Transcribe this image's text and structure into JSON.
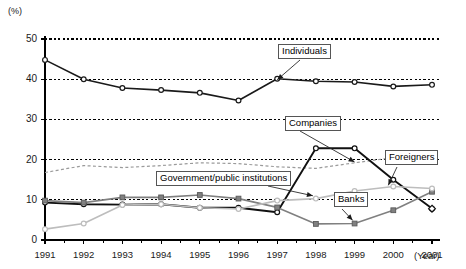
{
  "chart_data": {
    "type": "line",
    "title": "",
    "xlabel": "(Year)",
    "ylabel": "(%)",
    "ylim": [
      0,
      50
    ],
    "xlim": [
      1991,
      2001
    ],
    "grid": true,
    "grid_lines": [
      10,
      20,
      30,
      40,
      50
    ],
    "legend_position": "inline-callouts",
    "categories": [
      "1991",
      "1992",
      "1993",
      "1994",
      "1995",
      "1996",
      "1997",
      "1998",
      "1999",
      "2000",
      "2001"
    ],
    "series": [
      {
        "name": "Individuals",
        "marker": "open-circle",
        "color": "#1a1a1a",
        "values": [
          44.8,
          40.0,
          37.8,
          37.3,
          36.6,
          34.7,
          40.1,
          39.5,
          39.3,
          38.2,
          38.6
        ]
      },
      {
        "name": "Companies",
        "marker": "none",
        "style": "dashed",
        "color": "#9a9a9a",
        "values": [
          16.8,
          18.5,
          18.0,
          18.5,
          19.2,
          19.0,
          18.2,
          17.8,
          19.2,
          20.5,
          21.1
        ]
      },
      {
        "name": "Government/public institutions",
        "marker": "open-circle",
        "color": "#111111",
        "values": [
          9.3,
          8.9,
          8.8,
          8.9,
          8.0,
          8.0,
          6.9,
          22.8,
          22.8,
          15.0,
          7.8
        ]
      },
      {
        "name": "Banks",
        "marker": "filled-square",
        "color": "#808080",
        "values": [
          9.8,
          9.3,
          10.6,
          10.6,
          11.2,
          10.3,
          8.1,
          4.0,
          4.1,
          7.4,
          12.0
        ]
      },
      {
        "name": "Foreigners",
        "marker": "open-circle",
        "color": "#bdbdbd",
        "values": [
          2.7,
          4.1,
          8.7,
          8.9,
          8.0,
          7.7,
          9.8,
          10.3,
          12.2,
          13.3,
          12.8
        ]
      }
    ],
    "annotations": [
      {
        "label": "Individuals",
        "target_year": 1997,
        "target_value": 40.1
      },
      {
        "label": "Companies",
        "target_year": 1999,
        "target_value": 19.2
      },
      {
        "label": "Government/public institutions",
        "target_year": 1998,
        "target_value": 10.8
      },
      {
        "label": "Foreigners",
        "target_year": 2000,
        "target_value": 13.3
      },
      {
        "label": "Banks",
        "target_year": 1999,
        "target_value": 4.1
      }
    ]
  },
  "axis": {
    "unit_label": "(%)",
    "year_label": "(Year)",
    "y_ticks": [
      "0",
      "10",
      "20",
      "30",
      "40",
      "50"
    ],
    "x_ticks": [
      "1991",
      "1992",
      "1993",
      "1994",
      "1995",
      "1996",
      "1997",
      "1998",
      "1999",
      "2000",
      "2001"
    ]
  },
  "callouts": {
    "individuals": "Individuals",
    "companies": "Companies",
    "government": "Government/public institutions",
    "foreigners": "Foreigners",
    "banks": "Banks"
  },
  "colors": {
    "individuals": "#1a1a1a",
    "companies": "#9a9a9a",
    "government": "#111111",
    "banks": "#808080",
    "foreigners": "#bdbdbd",
    "axis": "#000000",
    "grid": "#000000"
  }
}
